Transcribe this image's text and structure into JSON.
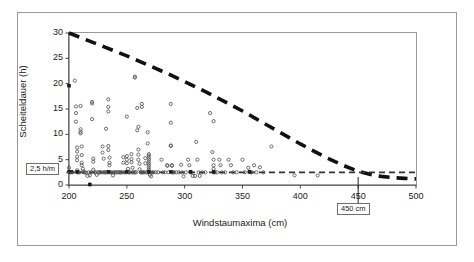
{
  "figure": {
    "background_color": "#ffffff",
    "frame_color": "#9a9a9a"
  },
  "chart_data": {
    "type": "scatter",
    "title": "",
    "subtitle": "",
    "xlabel": "Windstaumaxima (cm)",
    "ylabel": "Scheiteldauer (h)",
    "xlim": [
      200,
      500
    ],
    "ylim": [
      0,
      30
    ],
    "xticks": [
      200,
      250,
      300,
      350,
      400,
      450,
      500
    ],
    "xticklabels": [
      "200",
      "250",
      "300",
      "350",
      "400",
      "450",
      "500"
    ],
    "yticks": [
      0,
      5,
      10,
      15,
      20,
      25,
      30
    ],
    "yticklabels": [
      "0",
      "5",
      "10",
      "15",
      "20",
      "25",
      "30"
    ],
    "grid": false,
    "legend": null,
    "marker_color": "#555555",
    "marker_style": "open-circle",
    "series": [
      {
        "name": "Messwerte",
        "style": "scatter",
        "points": [
          [
            200,
            19.6
          ],
          [
            200,
            3.4
          ],
          [
            200,
            2.6
          ],
          [
            201,
            2.5
          ],
          [
            203,
            2.5
          ],
          [
            205,
            20.6
          ],
          [
            206,
            15.5
          ],
          [
            206,
            14.2
          ],
          [
            206,
            12.5
          ],
          [
            207,
            7.4
          ],
          [
            207,
            6.6
          ],
          [
            207,
            5.6
          ],
          [
            207,
            4.9
          ],
          [
            207,
            2.9
          ],
          [
            207,
            2.5
          ],
          [
            208,
            2.5
          ],
          [
            209,
            2.5
          ],
          [
            210,
            15.6
          ],
          [
            210,
            11.0
          ],
          [
            210,
            10.2
          ],
          [
            210,
            10.5
          ],
          [
            211,
            7.6
          ],
          [
            211,
            5.9
          ],
          [
            211,
            4.4
          ],
          [
            211,
            3.9
          ],
          [
            212,
            3.2
          ],
          [
            212,
            2.6
          ],
          [
            213,
            2.5
          ],
          [
            214,
            2.5
          ],
          [
            215,
            2.4
          ],
          [
            216,
            1.8
          ],
          [
            217,
            2.5
          ],
          [
            218,
            0.1
          ],
          [
            218,
            1.9
          ],
          [
            219,
            2.5
          ],
          [
            220,
            16.4
          ],
          [
            220,
            16.1
          ],
          [
            220,
            13.0
          ],
          [
            221,
            5.2
          ],
          [
            221,
            4.6
          ],
          [
            221,
            3.0
          ],
          [
            222,
            2.5
          ],
          [
            223,
            2.5
          ],
          [
            224,
            2.0
          ],
          [
            225,
            2.5
          ],
          [
            226,
            2.5
          ],
          [
            227,
            2.5
          ],
          [
            228,
            2.5
          ],
          [
            229,
            7.6
          ],
          [
            229,
            6.4
          ],
          [
            230,
            5.2
          ],
          [
            230,
            2.5
          ],
          [
            231,
            2.5
          ],
          [
            232,
            11.1
          ],
          [
            232,
            2.5
          ],
          [
            233,
            2.5
          ],
          [
            234,
            16.9
          ],
          [
            234,
            14.5
          ],
          [
            234,
            15.4
          ],
          [
            234,
            7.7
          ],
          [
            234,
            6.9
          ],
          [
            235,
            5.4
          ],
          [
            235,
            4.4
          ],
          [
            235,
            3.9
          ],
          [
            235,
            2.5
          ],
          [
            236,
            2.5
          ],
          [
            237,
            2.5
          ],
          [
            238,
            1.9
          ],
          [
            239,
            2.5
          ],
          [
            240,
            2.5
          ],
          [
            241,
            2.5
          ],
          [
            242,
            2.5
          ],
          [
            243,
            2.5
          ],
          [
            244,
            2.5
          ],
          [
            245,
            2.5
          ],
          [
            246,
            2.5
          ],
          [
            247,
            5.5
          ],
          [
            247,
            4.4
          ],
          [
            248,
            2.5
          ],
          [
            249,
            2.5
          ],
          [
            250,
            13.5
          ],
          [
            250,
            5.7
          ],
          [
            250,
            5.0
          ],
          [
            250,
            4.3
          ],
          [
            251,
            3.2
          ],
          [
            251,
            2.5
          ],
          [
            252,
            2.5
          ],
          [
            253,
            2.5
          ],
          [
            254,
            6.1
          ],
          [
            254,
            5.1
          ],
          [
            254,
            4.5
          ],
          [
            255,
            3.4
          ],
          [
            255,
            2.5
          ],
          [
            256,
            2.5
          ],
          [
            257,
            21.2
          ],
          [
            257,
            21.4
          ],
          [
            257,
            2.5
          ],
          [
            258,
            2.5
          ],
          [
            259,
            15.2
          ],
          [
            259,
            10.8
          ],
          [
            260,
            11.5
          ],
          [
            260,
            7.0
          ],
          [
            260,
            6.0
          ],
          [
            260,
            5.0
          ],
          [
            261,
            4.2
          ],
          [
            261,
            3.1
          ],
          [
            262,
            2.5
          ],
          [
            263,
            16.0
          ],
          [
            263,
            15.4
          ],
          [
            263,
            2.5
          ],
          [
            264,
            2.5
          ],
          [
            265,
            2.5
          ],
          [
            266,
            5.3
          ],
          [
            266,
            4.3
          ],
          [
            267,
            2.5
          ],
          [
            268,
            10.4
          ],
          [
            268,
            8.2
          ],
          [
            268,
            2.5
          ],
          [
            269,
            6.1
          ],
          [
            269,
            5.8
          ],
          [
            269,
            5.4
          ],
          [
            269,
            5.0
          ],
          [
            269,
            4.6
          ],
          [
            269,
            4.2
          ],
          [
            269,
            3.8
          ],
          [
            269,
            3.4
          ],
          [
            269,
            3.0
          ],
          [
            269,
            2.6
          ],
          [
            270,
            2.5
          ],
          [
            270,
            2.0
          ],
          [
            271,
            1.7
          ],
          [
            272,
            2.5
          ],
          [
            273,
            2.5
          ],
          [
            275,
            2.5
          ],
          [
            277,
            2.5
          ],
          [
            280,
            5.0
          ],
          [
            281,
            2.5
          ],
          [
            283,
            2.5
          ],
          [
            285,
            3.9
          ],
          [
            285,
            3.8
          ],
          [
            286,
            2.5
          ],
          [
            288,
            16.0
          ],
          [
            288,
            12.3
          ],
          [
            288,
            7.8
          ],
          [
            288,
            7.7
          ],
          [
            289,
            3.9
          ],
          [
            289,
            3.8
          ],
          [
            289,
            2.5
          ],
          [
            290,
            2.5
          ],
          [
            291,
            2.5
          ],
          [
            293,
            2.5
          ],
          [
            295,
            2.5
          ],
          [
            297,
            4.0
          ],
          [
            298,
            2.5
          ],
          [
            299,
            1.7
          ],
          [
            301,
            2.5
          ],
          [
            303,
            5.0
          ],
          [
            304,
            3.9
          ],
          [
            305,
            2.6
          ],
          [
            305,
            2.5
          ],
          [
            306,
            2.5
          ],
          [
            307,
            1.8
          ],
          [
            309,
            1.8
          ],
          [
            310,
            8.5
          ],
          [
            311,
            5.0
          ],
          [
            312,
            2.5
          ],
          [
            313,
            1.8
          ],
          [
            315,
            2.5
          ],
          [
            318,
            2.5
          ],
          [
            322,
            14.2
          ],
          [
            324,
            6.5
          ],
          [
            325,
            12.6
          ],
          [
            325,
            5.0
          ],
          [
            325,
            3.9
          ],
          [
            325,
            3.2
          ],
          [
            325,
            2.5
          ],
          [
            326,
            2.5
          ],
          [
            328,
            2.5
          ],
          [
            330,
            5.0
          ],
          [
            331,
            3.9
          ],
          [
            332,
            2.5
          ],
          [
            335,
            2.5
          ],
          [
            338,
            5.0
          ],
          [
            340,
            3.9
          ],
          [
            342,
            2.5
          ],
          [
            345,
            2.5
          ],
          [
            350,
            5.0
          ],
          [
            352,
            2.5
          ],
          [
            355,
            3.4
          ],
          [
            356,
            2.6
          ],
          [
            357,
            2.5
          ],
          [
            358,
            2.5
          ],
          [
            360,
            3.9
          ],
          [
            362,
            2.5
          ],
          [
            365,
            3.5
          ],
          [
            368,
            2.5
          ],
          [
            375,
            7.6
          ],
          [
            395,
            1.9
          ],
          [
            415,
            1.9
          ]
        ]
      },
      {
        "name": "Hervorgehobene Werte",
        "style": "scatter-filled",
        "points": [
          [
            200,
            19.6
          ],
          [
            200,
            2.6
          ],
          [
            202,
            2.6
          ],
          [
            207,
            2.6
          ],
          [
            218,
            0.1
          ],
          [
            234,
            2.6
          ],
          [
            250,
            2.6
          ],
          [
            269,
            2.6
          ],
          [
            288,
            2.6
          ],
          [
            305,
            2.6
          ],
          [
            325,
            2.6
          ],
          [
            356,
            2.6
          ]
        ]
      }
    ],
    "reference_lines": [
      {
        "name": "grenzkurve",
        "style": "dashed-thick",
        "color": "#111111",
        "description": "abfallende Grenzkurve von (200, 30) bis (500, 1.2)",
        "points": [
          [
            200,
            30.0
          ],
          [
            210,
            29.1
          ],
          [
            220,
            28.2
          ],
          [
            230,
            27.3
          ],
          [
            240,
            26.4
          ],
          [
            250,
            25.5
          ],
          [
            260,
            24.5
          ],
          [
            270,
            23.5
          ],
          [
            280,
            22.5
          ],
          [
            290,
            21.5
          ],
          [
            300,
            20.4
          ],
          [
            310,
            19.3
          ],
          [
            320,
            18.2
          ],
          [
            330,
            17.0
          ],
          [
            340,
            15.8
          ],
          [
            350,
            14.6
          ],
          [
            360,
            13.3
          ],
          [
            370,
            12.0
          ],
          [
            380,
            10.7
          ],
          [
            390,
            9.4
          ],
          [
            400,
            8.1
          ],
          [
            410,
            6.9
          ],
          [
            420,
            5.7
          ],
          [
            430,
            4.6
          ],
          [
            440,
            3.6
          ],
          [
            450,
            2.7
          ],
          [
            460,
            2.1
          ],
          [
            470,
            1.7
          ],
          [
            480,
            1.45
          ],
          [
            490,
            1.3
          ],
          [
            500,
            1.2
          ]
        ]
      },
      {
        "name": "schwellwert-linie",
        "style": "dashed-thin",
        "color": "#333333",
        "orientation": "horizontal",
        "value": 2.5,
        "x_from": 200,
        "x_to": 500
      }
    ],
    "annotations": [
      {
        "name": "threshold-callout",
        "text": "2,5 h/m",
        "target_axis": "y",
        "target_value": 2.5
      },
      {
        "name": "crossing-callout",
        "text": "450 cm",
        "target_axis": "x",
        "target_value": 450
      }
    ]
  }
}
